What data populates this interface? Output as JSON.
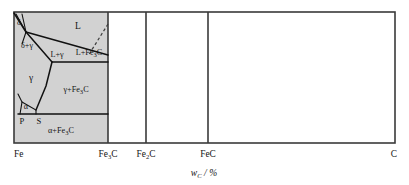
{
  "figure": {
    "title_axis_x": "w",
    "axis": {
      "x_title_symbol": "w",
      "x_title_subscript": "C",
      "x_title_unit": "/ %",
      "ticks": [
        {
          "label": "Fe",
          "sub": "",
          "tail": "",
          "x": 14
        },
        {
          "label": "Fe",
          "sub": "3",
          "tail": "C",
          "x": 108
        },
        {
          "label": "Fe",
          "sub": "2",
          "tail": "C",
          "x": 146
        },
        {
          "label": "Fe",
          "sub": "",
          "tail": "C",
          "x": 208
        },
        {
          "label": "C",
          "sub": "",
          "tail": "",
          "x": 395
        }
      ]
    },
    "regions": [
      {
        "name": "liquid",
        "label": "L",
        "sub": "",
        "tail": "",
        "x": 78,
        "y": 26
      },
      {
        "name": "delta-gamma",
        "label": "δ+γ",
        "sub": "",
        "tail": "",
        "x": 26,
        "y": 45
      },
      {
        "name": "delta",
        "label": "δ",
        "sub": "",
        "tail": "",
        "x": 19,
        "y": 22
      },
      {
        "name": "liquid-gamma",
        "label": "L+γ",
        "sub": "",
        "tail": "",
        "x": 56,
        "y": 54
      },
      {
        "name": "liquid-cementite",
        "label": "L+Fe",
        "sub": "3",
        "tail": "C",
        "x": 90,
        "y": 51
      },
      {
        "name": "gamma",
        "label": "γ",
        "sub": "",
        "tail": "",
        "x": 32,
        "y": 78
      },
      {
        "name": "gamma-cementite",
        "label": "γ+Fe",
        "sub": "3",
        "tail": "C",
        "x": 76,
        "y": 89
      },
      {
        "name": "alpha",
        "label": "α",
        "sub": "",
        "tail": "",
        "x": 25,
        "y": 106
      },
      {
        "name": "alpha-cementite",
        "label": "α+Fe",
        "sub": "3",
        "tail": "C",
        "x": 60,
        "y": 130
      }
    ],
    "points": [
      {
        "name": "point-P",
        "label": "P",
        "x": 22,
        "y": 119
      },
      {
        "name": "point-S",
        "label": "S",
        "x": 39,
        "y": 119
      }
    ],
    "colors": {
      "shaded_fill": "#d2d2d2",
      "frame_stroke": "#3a3a3a",
      "phase_stroke": "#111111",
      "background": "#ffffff"
    },
    "geometry": {
      "frame": {
        "left": 14,
        "top": 12,
        "right": 395,
        "bottom": 143
      },
      "dividers": [
        108,
        146,
        208
      ],
      "shaded_right": 108
    }
  }
}
